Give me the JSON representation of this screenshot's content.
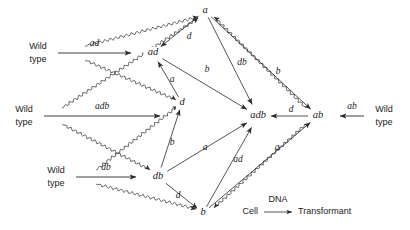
{
  "figure": {
    "title": "",
    "legend": {
      "from_label": "Cell",
      "arrow_label": "DNA",
      "to_label": "Transformant"
    },
    "wild_type_word_1": "Wild",
    "wild_type_word_2": "type",
    "nodes": [
      {
        "id": "a",
        "label": "a",
        "x": 205,
        "y": 11
      },
      {
        "id": "ad",
        "label": "ad",
        "x": 153,
        "y": 53
      },
      {
        "id": "d",
        "label": "d",
        "x": 182,
        "y": 103
      },
      {
        "id": "adb",
        "label": "adb",
        "x": 258,
        "y": 116
      },
      {
        "id": "db",
        "label": "db",
        "x": 158,
        "y": 177
      },
      {
        "id": "b",
        "label": "b",
        "x": 203,
        "y": 213
      },
      {
        "id": "ab",
        "label": "ab",
        "x": 318,
        "y": 116
      }
    ],
    "sources": [
      {
        "id": "src-ad",
        "donor_label": "ad",
        "side": "left",
        "target": "ad",
        "wild_x": 38,
        "wild_y": 53
      },
      {
        "id": "src-adb",
        "donor_label": "adb",
        "side": "left",
        "target": "d",
        "wild_x": 24,
        "wild_y": 116
      },
      {
        "id": "src-db",
        "donor_label": "db",
        "side": "left",
        "target": "db",
        "wild_x": 56,
        "wild_y": 177
      },
      {
        "id": "src-ab",
        "donor_label": "ab",
        "side": "right",
        "target": "ab",
        "wild_x": 384,
        "wild_y": 116
      }
    ],
    "edges": [
      {
        "from": "a",
        "to": "ad",
        "label": "d",
        "lx": 189,
        "ly": 37
      },
      {
        "from": "a",
        "to": "adb",
        "label": "db",
        "lx": 242,
        "ly": 63
      },
      {
        "from": "a",
        "to": "ab",
        "label": "b",
        "lx": 278,
        "ly": 72
      },
      {
        "from": "ad",
        "to": "adb",
        "label": "b",
        "lx": 207,
        "ly": 70
      },
      {
        "from": "d",
        "to": "ad",
        "label": "a",
        "lx": 172,
        "ly": 80
      },
      {
        "from": "db",
        "to": "d",
        "label": "b",
        "lx": 172,
        "ly": 143
      },
      {
        "from": "db",
        "to": "adb",
        "label": "a",
        "lx": 205,
        "ly": 148
      },
      {
        "from": "db",
        "to": "b",
        "label": "d",
        "lx": 178,
        "ly": 196
      },
      {
        "from": "b",
        "to": "adb",
        "label": "ad",
        "lx": 238,
        "ly": 160
      },
      {
        "from": "b",
        "to": "ab",
        "label": "a",
        "lx": 277,
        "ly": 148
      },
      {
        "from": "ab",
        "to": "adb",
        "label": "d",
        "lx": 291,
        "ly": 110
      }
    ],
    "colors": {
      "ink": "#2a2a2a",
      "background": "#ffffff"
    }
  }
}
